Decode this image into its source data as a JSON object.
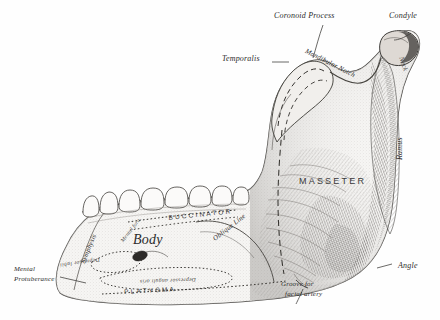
{
  "figure": {
    "background_color": "#fefefe",
    "ink_color": "#2b2b2b",
    "bone_fill": "#f4f3f1"
  },
  "labels": {
    "coronoid_process": "Coronoid Process",
    "condyle": "Condyle",
    "temporalis": "Temporalis",
    "mandibular_notch": "Mandibular Notch",
    "neck": "Neck",
    "ramus": "Ramus",
    "masseter": "MASSETER",
    "angle": "Angle",
    "groove_line1": "Groove for",
    "groove_line2": "facial artery",
    "body": "Body",
    "oblique_line": "Oblique Line",
    "buccinator": "BUCCINATOR",
    "platysma": "PLATYSMA",
    "symphysis": "Symphysis",
    "mental_protuberance_line1": "Mental",
    "mental_protuberance_line2": "Protuberance",
    "mental_foramen": "Mental fora.",
    "depressor_labii": "Depressor labii",
    "depressor_anguli_oris": "Depressor anguli oris"
  },
  "parts": [
    {
      "name": "coronoid-process",
      "region": "superior-anterior ramus"
    },
    {
      "name": "condyle",
      "region": "superior-posterior ramus"
    },
    {
      "name": "neck",
      "region": "below condyle"
    },
    {
      "name": "mandibular-notch",
      "region": "between coronoid and condyle"
    },
    {
      "name": "ramus",
      "region": "posterior vertical plate"
    },
    {
      "name": "angle",
      "region": "junction of ramus and body"
    },
    {
      "name": "body",
      "region": "horizontal anterior portion"
    },
    {
      "name": "oblique-line",
      "region": "lateral body ridge"
    },
    {
      "name": "mental-protuberance",
      "region": "anterior chin"
    },
    {
      "name": "symphysis",
      "region": "midline chin"
    },
    {
      "name": "mental-foramen",
      "region": "lateral body aperture"
    },
    {
      "name": "groove-for-facial-artery",
      "region": "inferior border near angle"
    }
  ],
  "muscle_attachments": [
    {
      "name": "temporalis",
      "site": "coronoid process"
    },
    {
      "name": "masseter",
      "site": "lateral ramus"
    },
    {
      "name": "buccinator",
      "site": "alveolar margin of body"
    },
    {
      "name": "platysma",
      "site": "inferior border of body"
    },
    {
      "name": "depressor-labii",
      "site": "anterior body"
    },
    {
      "name": "depressor-anguli-oris",
      "site": "lower anterior body"
    }
  ],
  "teeth": {
    "visible_crowns": 8,
    "arch": "lower dental arcade"
  }
}
